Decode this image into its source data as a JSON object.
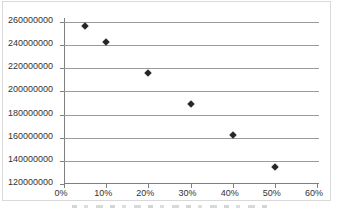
{
  "figure": {
    "background": "#ffffff",
    "border_color": "#d9d9d9",
    "caption_note": "partially cut-off caption text at bottom edge (illegible)"
  },
  "chart_data": {
    "type": "scatter",
    "title": "",
    "xlabel": "",
    "ylabel": "",
    "x_unit": "%",
    "x": [
      5,
      10,
      20,
      30,
      40,
      50
    ],
    "y": [
      256500000,
      243000000,
      216000000,
      189000000,
      162000000,
      135000000
    ],
    "xlim": [
      0,
      60
    ],
    "ylim": [
      120000000,
      260000000
    ],
    "x_tick_values": [
      0,
      10,
      20,
      30,
      40,
      50,
      60
    ],
    "x_tick_labels": [
      "0%",
      "10%",
      "20%",
      "30%",
      "40%",
      "50%",
      "60%"
    ],
    "y_tick_values": [
      260000000,
      240000000,
      220000000,
      200000000,
      180000000,
      160000000,
      140000000,
      120000000
    ],
    "y_tick_labels": [
      "260000000",
      "240000000",
      "220000000",
      "200000000",
      "180000000",
      "160000000",
      "140000000",
      "120000000"
    ],
    "grid": true,
    "legend": "none",
    "marker": {
      "shape": "diamond",
      "color": "#262626",
      "size": 7
    },
    "colors": {
      "gridline": "#9b9b9b",
      "axis": "#7f7f7f",
      "tick_label": "#333333"
    }
  }
}
